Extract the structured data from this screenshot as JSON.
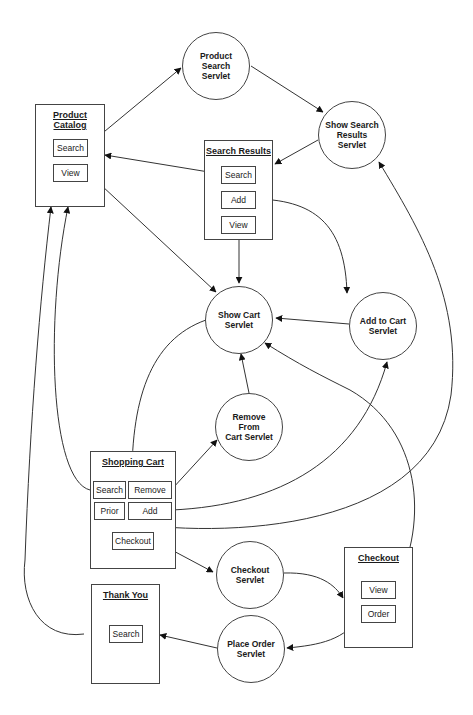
{
  "diagram": {
    "type": "page-flow / servlet navigation diagram",
    "pages": {
      "product_catalog": {
        "title": "Product Catalog",
        "buttons": [
          "Search",
          "View"
        ]
      },
      "search_results": {
        "title": "Search Results",
        "buttons": [
          "Search",
          "Add",
          "View"
        ]
      },
      "shopping_cart": {
        "title": "Shopping Cart",
        "buttons": [
          "Search",
          "Remove",
          "Prior",
          "Add",
          "Checkout"
        ]
      },
      "checkout": {
        "title": "Checkout",
        "buttons": [
          "View",
          "Order"
        ]
      },
      "thank_you": {
        "title": "Thank You",
        "buttons": [
          "Search"
        ]
      }
    },
    "servlets": {
      "product_search": {
        "line1": "Product Search",
        "line2": "Servlet"
      },
      "show_search_results": {
        "line1": "Show Search",
        "line2": "Results Servlet"
      },
      "show_cart": {
        "line1": "Show Cart",
        "line2": "Servlet"
      },
      "add_to_cart": {
        "line1": "Add to Cart",
        "line2": "Servlet"
      },
      "remove_from_cart": {
        "line1": "Remove From",
        "line2": "Cart Servlet"
      },
      "checkout": {
        "line1": "Checkout",
        "line2": "Servlet"
      },
      "place_order": {
        "line1": "Place Order",
        "line2": "Servlet"
      }
    },
    "edges": [
      {
        "from": "Product Catalog.Search",
        "to": "Product Search Servlet"
      },
      {
        "from": "Product Search Servlet",
        "to": "Show Search Results Servlet"
      },
      {
        "from": "Show Search Results Servlet",
        "to": "Search Results"
      },
      {
        "from": "Search Results.Search",
        "to": "Product Catalog"
      },
      {
        "from": "Search Results.Add",
        "to": "Add to Cart Servlet"
      },
      {
        "from": "Search Results.View",
        "to": "Show Cart Servlet"
      },
      {
        "from": "Product Catalog.View",
        "to": "Show Cart Servlet"
      },
      {
        "from": "Add to Cart Servlet",
        "to": "Show Cart Servlet"
      },
      {
        "from": "Show Cart Servlet",
        "to": "Shopping Cart"
      },
      {
        "from": "Remove From Cart Servlet",
        "to": "Show Cart Servlet"
      },
      {
        "from": "Shopping Cart.Remove",
        "to": "Remove From Cart Servlet"
      },
      {
        "from": "Shopping Cart.Add",
        "to": "Add to Cart Servlet"
      },
      {
        "from": "Shopping Cart.Search",
        "to": "Product Catalog"
      },
      {
        "from": "Shopping Cart.Prior",
        "to": "Show Search Results Servlet"
      },
      {
        "from": "Shopping Cart.Checkout",
        "to": "Checkout Servlet"
      },
      {
        "from": "Checkout Servlet",
        "to": "Checkout"
      },
      {
        "from": "Checkout.View",
        "to": "Show Cart Servlet"
      },
      {
        "from": "Checkout.Order",
        "to": "Place Order Servlet"
      },
      {
        "from": "Place Order Servlet",
        "to": "Thank You"
      },
      {
        "from": "Thank You.Search",
        "to": "Product Catalog"
      }
    ]
  }
}
